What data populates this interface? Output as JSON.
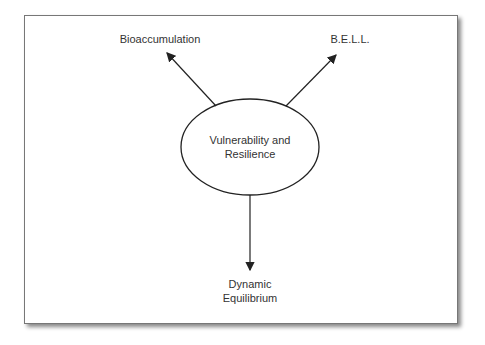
{
  "diagram": {
    "center_node": {
      "line1": "Vulnerability and",
      "line2": "Resilience"
    },
    "nodes": [
      {
        "id": "bioaccumulation",
        "label": "Bioaccumulation"
      },
      {
        "id": "bell",
        "label": "B.E.L.L."
      },
      {
        "id": "dynamic",
        "line1": "Dynamic",
        "line2": "Equilibrium"
      }
    ],
    "edges": [
      {
        "from": "Vulnerability and Resilience",
        "to": "Bioaccumulation"
      },
      {
        "from": "Vulnerability and Resilience",
        "to": "B.E.L.L."
      },
      {
        "from": "Vulnerability and Resilience",
        "to": "Dynamic Equilibrium"
      }
    ]
  }
}
